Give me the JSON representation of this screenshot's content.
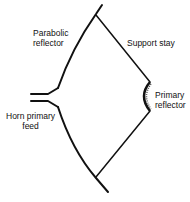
{
  "diagram": {
    "labels": {
      "parabolic_reflector_line1": "Parabolic",
      "parabolic_reflector_line2": "reflector",
      "support_stay": "Support stay",
      "primary_reflector_line1": "Primary",
      "primary_reflector_line2": "reflector",
      "horn_feed_line1": "Horn primary",
      "horn_feed_line2": "feed"
    },
    "colors": {
      "line": "#111111",
      "background": "#ffffff"
    }
  }
}
